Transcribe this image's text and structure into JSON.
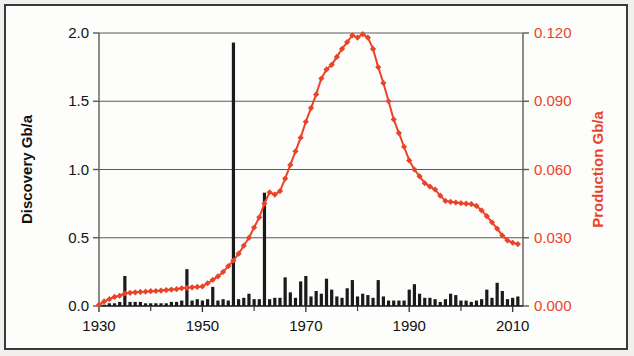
{
  "figure": {
    "background_color": "#fdfdfb",
    "border_color": "#3a3a3a"
  },
  "chart_data": {
    "type": "bar",
    "title": "",
    "subtitle": "",
    "xlabel": "",
    "ylabel": "Discovery Gb/a",
    "y2label": "Production Gb/a",
    "xlim": [
      1930,
      2012
    ],
    "ylim": [
      0.0,
      2.0
    ],
    "y2lim": [
      0.0,
      0.12
    ],
    "grid": true,
    "legend_position": "none",
    "xticks": [
      1930,
      1950,
      1970,
      1990,
      2010
    ],
    "xticklabels": [
      "1930",
      "1950",
      "1970",
      "1990",
      "2010"
    ],
    "xminorticks": [
      1940,
      1960,
      1980,
      2000
    ],
    "yticks": [
      0.0,
      0.5,
      1.0,
      1.5,
      2.0
    ],
    "yticklabels": [
      "0.0",
      "0.5",
      "1.0",
      "1.5",
      "2.0"
    ],
    "y2ticks": [
      0.0,
      0.03,
      0.06,
      0.09,
      0.12
    ],
    "y2ticklabels": [
      "0.000",
      "0.030",
      "0.060",
      "0.090",
      "0.120"
    ],
    "series": [
      {
        "name": "Discovery Gb/a",
        "type": "bar",
        "axis": "left",
        "color": "#1a1a1a",
        "x": [
          1930,
          1931,
          1932,
          1933,
          1934,
          1935,
          1936,
          1937,
          1938,
          1939,
          1940,
          1941,
          1942,
          1943,
          1944,
          1945,
          1946,
          1947,
          1948,
          1949,
          1950,
          1951,
          1952,
          1953,
          1954,
          1955,
          1956,
          1957,
          1958,
          1959,
          1960,
          1961,
          1962,
          1963,
          1964,
          1965,
          1966,
          1967,
          1968,
          1969,
          1970,
          1971,
          1972,
          1973,
          1974,
          1975,
          1976,
          1977,
          1978,
          1979,
          1980,
          1981,
          1982,
          1983,
          1984,
          1985,
          1986,
          1987,
          1988,
          1989,
          1990,
          1991,
          1992,
          1993,
          1994,
          1995,
          1996,
          1997,
          1998,
          1999,
          2000,
          2001,
          2002,
          2003,
          2004,
          2005,
          2006,
          2007,
          2008,
          2009,
          2010,
          2011
        ],
        "values": [
          0.01,
          0.01,
          0.02,
          0.02,
          0.03,
          0.22,
          0.03,
          0.03,
          0.03,
          0.02,
          0.02,
          0.02,
          0.02,
          0.02,
          0.03,
          0.03,
          0.04,
          0.27,
          0.04,
          0.05,
          0.04,
          0.05,
          0.14,
          0.04,
          0.05,
          0.04,
          1.93,
          0.05,
          0.06,
          0.09,
          0.05,
          0.05,
          0.83,
          0.05,
          0.06,
          0.06,
          0.21,
          0.1,
          0.06,
          0.18,
          0.22,
          0.07,
          0.11,
          0.09,
          0.2,
          0.12,
          0.07,
          0.06,
          0.13,
          0.19,
          0.07,
          0.09,
          0.08,
          0.06,
          0.19,
          0.07,
          0.04,
          0.04,
          0.04,
          0.04,
          0.12,
          0.16,
          0.09,
          0.06,
          0.06,
          0.05,
          0.03,
          0.05,
          0.09,
          0.08,
          0.04,
          0.04,
          0.03,
          0.04,
          0.05,
          0.12,
          0.06,
          0.17,
          0.11,
          0.05,
          0.06,
          0.07
        ]
      },
      {
        "name": "Production Gb/a",
        "type": "line",
        "axis": "right",
        "color": "#e8442a",
        "marker": "diamond",
        "x": [
          1930,
          1931,
          1932,
          1933,
          1934,
          1935,
          1936,
          1937,
          1938,
          1939,
          1940,
          1941,
          1942,
          1943,
          1944,
          1945,
          1946,
          1947,
          1948,
          1949,
          1950,
          1951,
          1952,
          1953,
          1954,
          1955,
          1956,
          1957,
          1958,
          1959,
          1960,
          1961,
          1962,
          1963,
          1964,
          1965,
          1966,
          1967,
          1968,
          1969,
          1970,
          1971,
          1972,
          1973,
          1974,
          1975,
          1976,
          1977,
          1978,
          1979,
          1980,
          1981,
          1982,
          1983,
          1984,
          1985,
          1986,
          1987,
          1988,
          1989,
          1990,
          1991,
          1992,
          1993,
          1994,
          1995,
          1996,
          1997,
          1998,
          1999,
          2000,
          2001,
          2002,
          2003,
          2004,
          2005,
          2006,
          2007,
          2008,
          2009,
          2010,
          2011
        ],
        "values": [
          0.0005,
          0.002,
          0.003,
          0.004,
          0.0045,
          0.0055,
          0.0058,
          0.006,
          0.0062,
          0.0063,
          0.0065,
          0.0066,
          0.0068,
          0.007,
          0.0072,
          0.0074,
          0.0078,
          0.008,
          0.0082,
          0.0084,
          0.0086,
          0.01,
          0.0115,
          0.013,
          0.015,
          0.0175,
          0.02,
          0.023,
          0.0265,
          0.03,
          0.0345,
          0.039,
          0.045,
          0.05,
          0.049,
          0.0505,
          0.056,
          0.062,
          0.068,
          0.074,
          0.081,
          0.087,
          0.093,
          0.1,
          0.104,
          0.106,
          0.1095,
          0.113,
          0.116,
          0.119,
          0.118,
          0.1195,
          0.118,
          0.113,
          0.105,
          0.098,
          0.09,
          0.082,
          0.076,
          0.07,
          0.064,
          0.06,
          0.057,
          0.054,
          0.0525,
          0.0512,
          0.0485,
          0.0462,
          0.0458,
          0.0455,
          0.0452,
          0.045,
          0.0448,
          0.044,
          0.042,
          0.0395,
          0.0368,
          0.034,
          0.031,
          0.0288,
          0.0278,
          0.0272
        ]
      }
    ]
  }
}
